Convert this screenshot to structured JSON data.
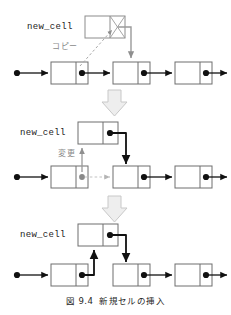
{
  "figure": {
    "caption_number": "図 9.4",
    "caption_text": "新規セルの挿入",
    "colors": {
      "ink": "#1a1a1a",
      "cell_border": "#6e6e6e",
      "arrow_solid": "#111111",
      "ghost_arrow": "#bfbfbf",
      "hint_label": "#8a8a8a",
      "big_arrow_fill": "#eeeeee",
      "big_arrow_stroke": "#c8c8c8",
      "background": "#ffffff"
    }
  },
  "panels": [
    {
      "id": "step-1",
      "name": "copy-step",
      "new_cell_label": "new_cell",
      "hint_label": "コピー",
      "description": "new_cell の next に 2 番目のセルへのポインタをコピーする",
      "cells": [
        {
          "index": 0,
          "data": "",
          "has_pointer_dot": true
        },
        {
          "index": 1,
          "data": "",
          "has_pointer_dot": true
        },
        {
          "index": 2,
          "data": "",
          "has_pointer_dot": true
        }
      ]
    },
    {
      "id": "step-2",
      "name": "update-step",
      "new_cell_label": "new_cell",
      "hint_label": "変更",
      "description": "1 番目のセルの next を new_cell に変更する",
      "cells": [
        {
          "index": 0,
          "data": "",
          "has_pointer_dot": true
        },
        {
          "index": 1,
          "data": "",
          "has_pointer_dot": true
        },
        {
          "index": 2,
          "data": "",
          "has_pointer_dot": true
        }
      ]
    },
    {
      "id": "step-3",
      "name": "result-step",
      "new_cell_label": "new_cell",
      "hint_label": "",
      "description": "挿入完了後のリスト",
      "cells": [
        {
          "index": 0,
          "data": "",
          "has_pointer_dot": true
        },
        {
          "index": 1,
          "data": "",
          "has_pointer_dot": true
        },
        {
          "index": 2,
          "data": "",
          "has_pointer_dot": true
        }
      ]
    }
  ],
  "transitions": [
    {
      "name": "step-arrow-1",
      "glyph": "down-block-arrow"
    },
    {
      "name": "step-arrow-2",
      "glyph": "down-block-arrow"
    }
  ]
}
